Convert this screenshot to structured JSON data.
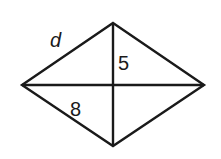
{
  "diagram": {
    "shape": "rhombus",
    "vertices": {
      "top": [
        113,
        23
      ],
      "left": [
        22,
        85
      ],
      "right": [
        204,
        85
      ],
      "bottom": [
        113,
        146
      ]
    },
    "center": [
      113,
      85
    ],
    "stroke_color": "#1a1a1a",
    "labels": {
      "side": "d",
      "half_vertical_diagonal": "5",
      "half_horizontal_diagonal": "8"
    }
  }
}
